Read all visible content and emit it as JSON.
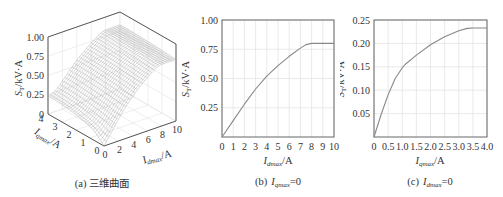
{
  "chart_data": [
    {
      "type": "surface",
      "panel": "a",
      "caption": "(a) 三维曲面",
      "zlabel": "S_T/kV·A",
      "xlabel": "I_dmax/A",
      "ylabel": "I_qmax/A",
      "z_ticks": [
        "0",
        "0.25",
        "0.50",
        "0.75",
        "1.00"
      ],
      "x_ticks": [
        "0",
        "2",
        "4",
        "6",
        "8",
        "10"
      ],
      "y_ticks": [
        "0",
        "1",
        "2",
        "3",
        "4"
      ],
      "xlim": [
        0,
        10
      ],
      "ylim": [
        0,
        4
      ],
      "zlim": [
        0,
        1.0
      ],
      "grid": true,
      "description": "Mesh surface of S_T over I_dmax (0-10 A) and I_qmax (0-4 A); rises from 0 at origin to ~0.8 along I_dmax and ~0.23 along I_qmax"
    },
    {
      "type": "line",
      "panel": "b",
      "caption_prefix": "(b)",
      "caption_var": "I",
      "caption_sub": "qmax",
      "caption_suffix": "=0",
      "xlabel": "I_dmax/A",
      "ylabel": "S_T/kV·A",
      "x_ticks": [
        "0",
        "1",
        "2",
        "3",
        "4",
        "5",
        "6",
        "7",
        "8",
        "9",
        "10"
      ],
      "y_ticks": [
        "0.25",
        "0.50",
        "0.75",
        "1.00"
      ],
      "xlim": [
        0,
        10
      ],
      "ylim": [
        0,
        1.0
      ],
      "grid": true,
      "x": [
        0,
        1,
        2,
        3,
        4,
        5,
        6,
        7,
        7.5,
        8,
        9,
        10
      ],
      "values": [
        0,
        0.14,
        0.28,
        0.41,
        0.52,
        0.61,
        0.69,
        0.76,
        0.79,
        0.8,
        0.8,
        0.8
      ]
    },
    {
      "type": "line",
      "panel": "c",
      "caption_prefix": "(c)",
      "caption_var": "I",
      "caption_sub": "dmax",
      "caption_suffix": "=0",
      "xlabel": "I_qmax/A",
      "ylabel": "S_T/kV·A",
      "x_ticks": [
        "0",
        "0.5",
        "1.0",
        "1.5",
        "2.0",
        "2.5",
        "3.0",
        "3.5",
        "4.0"
      ],
      "y_ticks": [
        "0.05",
        "0.10",
        "0.15",
        "0.20",
        "0.25"
      ],
      "xlim": [
        0,
        4.0
      ],
      "ylim": [
        0,
        0.25
      ],
      "grid": true,
      "x": [
        0,
        0.25,
        0.5,
        0.75,
        1.0,
        1.1,
        1.5,
        2.0,
        2.5,
        3.0,
        3.3,
        3.5,
        4.0
      ],
      "values": [
        0,
        0.048,
        0.09,
        0.125,
        0.148,
        0.155,
        0.175,
        0.197,
        0.214,
        0.227,
        0.232,
        0.233,
        0.233
      ]
    }
  ],
  "labels": {
    "a_caption": "(a) 三维曲面",
    "b_prefix": "(b)",
    "c_prefix": "(c)",
    "ylabel_main": "S",
    "ylabel_sub": "T",
    "ylabel_unit": "/kV·A",
    "i_var": "I",
    "sub_dmax": "dmax",
    "sub_qmax": "qmax",
    "unit_A": "/A",
    "eq_zero": "=0"
  }
}
